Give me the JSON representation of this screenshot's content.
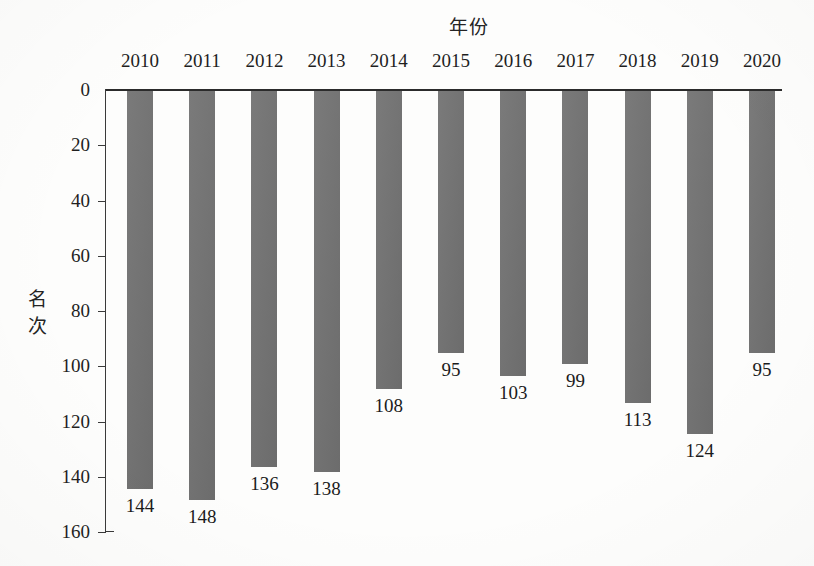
{
  "chart_data": {
    "type": "bar",
    "title": "年份",
    "xlabel": "年份",
    "ylabel": "名次",
    "categories": [
      "2010",
      "2011",
      "2012",
      "2013",
      "2014",
      "2015",
      "2016",
      "2017",
      "2018",
      "2019",
      "2020"
    ],
    "values": [
      144,
      148,
      136,
      138,
      108,
      95,
      103,
      99,
      113,
      124,
      95
    ],
    "value_labels": [
      "144",
      "148",
      "136",
      "138",
      "108",
      "95",
      "103",
      "99",
      "113",
      "124",
      "95"
    ],
    "ylim": [
      0,
      160
    ],
    "y_axis_inverted": true,
    "y_tick_labels": [
      "0",
      "20",
      "40",
      "60",
      "80",
      "100",
      "120",
      "140",
      "160"
    ],
    "y_tick_values": [
      0,
      20,
      40,
      60,
      80,
      100,
      120,
      140,
      160
    ],
    "grid": false,
    "legend": "none",
    "bar_color": "#737373",
    "axis_color": "#2b2b2b",
    "text_color": "#1b1b1b",
    "background_color": "#fdfdfc"
  },
  "axis_title_vertical_chars": [
    "名",
    "次"
  ]
}
